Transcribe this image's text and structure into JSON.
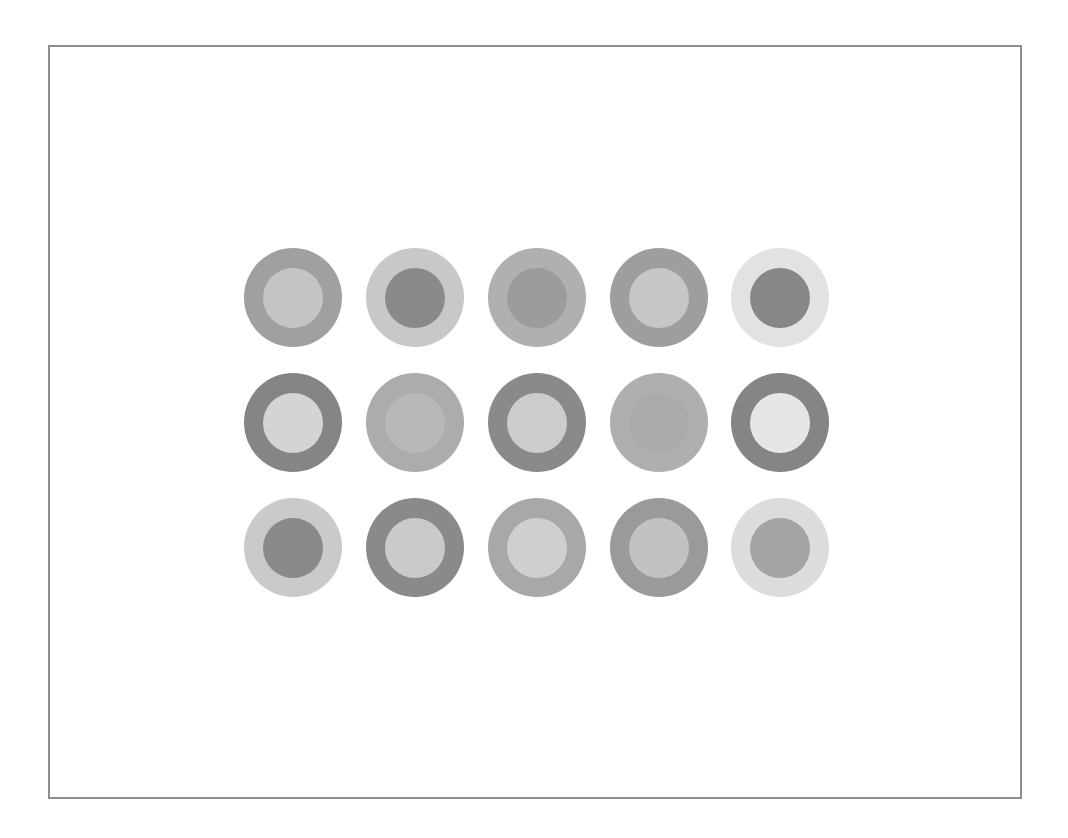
{
  "figure": {
    "frame_color": "#8e8e8e",
    "background": "#ffffff",
    "grid": {
      "rows": 3,
      "cols": 5
    },
    "circles": [
      [
        {
          "outer": "#a0a0a0",
          "inner": "#c4c4c4"
        },
        {
          "outer": "#c8c8c8",
          "inner": "#8a8a8a"
        },
        {
          "outer": "#b0b0b0",
          "inner": "#9c9c9c"
        },
        {
          "outer": "#9e9e9e",
          "inner": "#c6c6c6"
        },
        {
          "outer": "#e2e2e2",
          "inner": "#878787"
        }
      ],
      [
        {
          "outer": "#858585",
          "inner": "#d4d4d4"
        },
        {
          "outer": "#acacac",
          "inner": "#b8b8b8"
        },
        {
          "outer": "#8a8a8a",
          "inner": "#cccccc"
        },
        {
          "outer": "#afafaf",
          "inner": "#ababab"
        },
        {
          "outer": "#858585",
          "inner": "#e6e6e6"
        }
      ],
      [
        {
          "outer": "#cacaca",
          "inner": "#8a8a8a"
        },
        {
          "outer": "#8a8a8a",
          "inner": "#cacaca"
        },
        {
          "outer": "#a8a8a8",
          "inner": "#cfcfcf"
        },
        {
          "outer": "#9a9a9a",
          "inner": "#c2c2c2"
        },
        {
          "outer": "#dcdcdc",
          "inner": "#a3a3a3"
        }
      ]
    ]
  }
}
